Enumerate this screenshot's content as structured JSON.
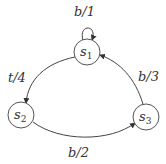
{
  "diagram": {
    "type": "state-machine",
    "nodes": [
      {
        "id": "s1",
        "base": "s",
        "sub": "1",
        "cx": 87,
        "cy": 52
      },
      {
        "id": "s2",
        "base": "s",
        "sub": "2",
        "cx": 21,
        "cy": 115
      },
      {
        "id": "s3",
        "base": "s",
        "sub": "3",
        "cx": 146,
        "cy": 117
      }
    ],
    "edges": [
      {
        "from": "s1",
        "to": "s1",
        "label": "b/1"
      },
      {
        "from": "s1",
        "to": "s2",
        "label": "t/4"
      },
      {
        "from": "s2",
        "to": "s3",
        "label": "b/2"
      },
      {
        "from": "s3",
        "to": "s1",
        "label": "b/3"
      }
    ]
  },
  "labels": {
    "loop": "b/1",
    "s1_s2": "t/4",
    "s2_s3": "b/2",
    "s3_s1": "b/3",
    "s1_base": "s",
    "s1_sub": "1",
    "s2_base": "s",
    "s2_sub": "2",
    "s3_base": "s",
    "s3_sub": "3"
  },
  "colors": {
    "stroke": "#444444",
    "background": "#ffffff"
  }
}
